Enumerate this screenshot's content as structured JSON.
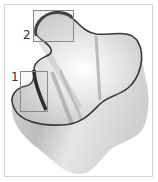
{
  "figure": {
    "callouts": [
      {
        "id": "1",
        "label": "1"
      },
      {
        "id": "2",
        "label": "2"
      }
    ]
  },
  "colors": {
    "frame": "#d4d4d4",
    "callout_box": "#8a8a8a",
    "rim": "#3a3a3a",
    "glass_light": "#f2f2f2",
    "glass_mid": "#c8c8c8",
    "glass_dark": "#8c8c8c"
  }
}
